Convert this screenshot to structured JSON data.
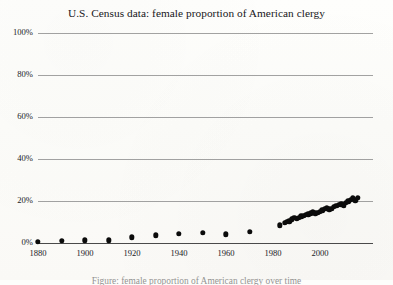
{
  "figure": {
    "title": "U.S. Census data: female proportion of American clergy",
    "caption_partial": "Figure: female proportion of American clergy over time",
    "background_color": "#fdfdfb",
    "dot_color": "#0b0b0b",
    "gridline_color": "#8e8e8e",
    "axis_color": "#4a4a4a"
  },
  "chart_data": {
    "type": "scatter",
    "title": "U.S. Census data: female proportion of American clergy",
    "xlabel": "",
    "ylabel": "",
    "xlim": [
      1880,
      2016
    ],
    "ylim": [
      0,
      100
    ],
    "yticks": [
      0,
      20,
      40,
      60,
      80,
      100
    ],
    "ytick_labels": [
      "0%",
      "20%",
      "40%",
      "60%",
      "80%",
      "100%"
    ],
    "xticks": [
      1880,
      1900,
      1920,
      1940,
      1960,
      1980,
      2000
    ],
    "xtick_labels": [
      "1880",
      "1900",
      "1920",
      "1940",
      "1960",
      "1980",
      "2000"
    ],
    "grid": true,
    "legend": false,
    "units": "percent",
    "series": [
      {
        "name": "female proportion of American clergy",
        "points": [
          [
            1880,
            0.6
          ],
          [
            1890,
            1.1
          ],
          [
            1900,
            1.3
          ],
          [
            1910,
            1.2
          ],
          [
            1920,
            2.7
          ],
          [
            1930,
            3.6
          ],
          [
            1940,
            4.3
          ],
          [
            1950,
            5.0
          ],
          [
            1960,
            4.2
          ],
          [
            1970,
            5.3
          ],
          [
            1983,
            8.4
          ],
          [
            1985,
            9.6
          ],
          [
            1986,
            10.2
          ],
          [
            1987,
            10.4
          ],
          [
            1988,
            11.3
          ],
          [
            1989,
            11.9
          ],
          [
            1990,
            11.4
          ],
          [
            1991,
            12.1
          ],
          [
            1992,
            12.8
          ],
          [
            1993,
            13.0
          ],
          [
            1994,
            13.4
          ],
          [
            1995,
            13.7
          ],
          [
            1996,
            14.2
          ],
          [
            1997,
            14.6
          ],
          [
            1998,
            14.1
          ],
          [
            1999,
            14.4
          ],
          [
            2000,
            14.9
          ],
          [
            2001,
            15.6
          ],
          [
            2002,
            16.2
          ],
          [
            2003,
            16.6
          ],
          [
            2004,
            16.0
          ],
          [
            2005,
            16.4
          ],
          [
            2006,
            17.2
          ],
          [
            2007,
            17.6
          ],
          [
            2008,
            18.1
          ],
          [
            2009,
            18.5
          ],
          [
            2010,
            18.0
          ],
          [
            2011,
            19.2
          ],
          [
            2012,
            19.8
          ],
          [
            2013,
            20.6
          ],
          [
            2014,
            21.2
          ],
          [
            2015,
            20.4
          ],
          [
            2016,
            21.5
          ]
        ]
      }
    ]
  }
}
